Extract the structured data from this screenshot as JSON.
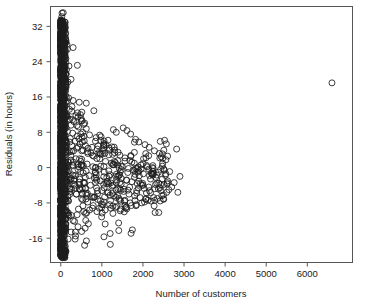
{
  "chart_data": {
    "type": "scatter",
    "title": "",
    "xlabel": "Number of customers",
    "ylabel": "Residuals (in hours)",
    "xlim": [
      -250,
      7100
    ],
    "ylim": [
      -21.5,
      36.5
    ],
    "xticks": [
      0,
      1000,
      2000,
      3000,
      4000,
      5000,
      6000
    ],
    "xticklabels": [
      "0",
      "1000",
      "2000",
      "3000",
      "4000",
      "5000",
      "6000"
    ],
    "yticks": [
      -16,
      -8,
      0,
      8,
      16,
      24,
      32
    ],
    "yticklabels": [
      "-16",
      "-8",
      "0",
      "8",
      "16",
      "24",
      "32"
    ],
    "grid": false,
    "legend": null,
    "marker": "open-circle",
    "marker_size": 3.0,
    "marker_color": "#1c1c1c",
    "frame_color": "#555555",
    "background_color": "#ffffff",
    "points": [
      [
        6600,
        19.2
      ],
      [
        30,
        35.0
      ],
      [
        60,
        35.1
      ],
      [
        25,
        34.2
      ],
      [
        45,
        32.6
      ],
      [
        20,
        32.3
      ],
      [
        55,
        31.0
      ],
      [
        35,
        30.4
      ],
      [
        70,
        29.8
      ],
      [
        40,
        29.2
      ],
      [
        90,
        28.5
      ],
      [
        150,
        27.9
      ],
      [
        300,
        27.2
      ],
      [
        160,
        26.8
      ],
      [
        65,
        28.0
      ],
      [
        85,
        27.0
      ],
      [
        110,
        26.2
      ],
      [
        50,
        25.8
      ],
      [
        30,
        25.0
      ],
      [
        75,
        24.4
      ],
      [
        120,
        23.8
      ],
      [
        200,
        23.0
      ],
      [
        140,
        22.2
      ],
      [
        60,
        21.6
      ],
      [
        40,
        21.0
      ],
      [
        95,
        20.4
      ],
      [
        250,
        20.0
      ],
      [
        175,
        19.4
      ],
      [
        55,
        18.8
      ],
      [
        130,
        18.2
      ],
      [
        80,
        17.6
      ],
      [
        45,
        17.0
      ],
      [
        115,
        16.4
      ],
      [
        190,
        15.8
      ],
      [
        300,
        15.2
      ],
      [
        450,
        14.8
      ],
      [
        620,
        14.6
      ],
      [
        70,
        15.6
      ],
      [
        155,
        15.0
      ],
      [
        100,
        14.2
      ],
      [
        35,
        13.8
      ],
      [
        210,
        13.2
      ],
      [
        265,
        12.8
      ],
      [
        410,
        12.4
      ],
      [
        480,
        12.0
      ],
      [
        90,
        12.6
      ],
      [
        140,
        11.8
      ],
      [
        60,
        11.2
      ],
      [
        180,
        10.8
      ],
      [
        320,
        10.4
      ],
      [
        520,
        10.6
      ],
      [
        560,
        9.8
      ],
      [
        430,
        9.2
      ],
      [
        250,
        9.6
      ],
      [
        130,
        9.0
      ],
      [
        75,
        8.6
      ],
      [
        165,
        8.2
      ],
      [
        290,
        7.8
      ],
      [
        620,
        8.8
      ],
      [
        700,
        7.4
      ],
      [
        860,
        6.8
      ],
      [
        980,
        7.0
      ],
      [
        1150,
        6.2
      ],
      [
        1280,
        8.6
      ],
      [
        1350,
        8.0
      ],
      [
        1520,
        9.0
      ],
      [
        1610,
        8.4
      ],
      [
        1700,
        7.6
      ],
      [
        1820,
        6.4
      ],
      [
        1900,
        5.8
      ],
      [
        2050,
        5.2
      ],
      [
        2150,
        4.6
      ],
      [
        2280,
        3.8
      ],
      [
        2400,
        3.2
      ],
      [
        2600,
        2.6
      ],
      [
        2820,
        4.2
      ],
      [
        110,
        7.2
      ],
      [
        230,
        6.6
      ],
      [
        350,
        6.0
      ],
      [
        470,
        5.4
      ],
      [
        600,
        5.0
      ],
      [
        760,
        4.6
      ],
      [
        890,
        4.2
      ],
      [
        1020,
        3.8
      ],
      [
        1180,
        4.4
      ],
      [
        1310,
        3.4
      ],
      [
        1440,
        2.8
      ],
      [
        1560,
        2.2
      ],
      [
        1680,
        1.6
      ],
      [
        1790,
        1.0
      ],
      [
        1950,
        0.6
      ],
      [
        2100,
        0.2
      ],
      [
        2250,
        -0.2
      ],
      [
        2430,
        -0.4
      ],
      [
        2520,
        -0.6
      ],
      [
        2650,
        -0.9
      ],
      [
        55,
        6.4
      ],
      [
        140,
        5.6
      ],
      [
        270,
        5.0
      ],
      [
        390,
        4.4
      ],
      [
        510,
        3.8
      ],
      [
        660,
        3.2
      ],
      [
        800,
        2.6
      ],
      [
        950,
        2.0
      ],
      [
        1090,
        1.4
      ],
      [
        1230,
        1.0
      ],
      [
        1380,
        0.6
      ],
      [
        1500,
        0.2
      ],
      [
        1650,
        -0.2
      ],
      [
        1760,
        -0.6
      ],
      [
        1880,
        -1.0
      ],
      [
        2010,
        -1.4
      ],
      [
        2160,
        -1.8
      ],
      [
        2310,
        -2.2
      ],
      [
        2470,
        -2.6
      ],
      [
        2600,
        -3.0
      ],
      [
        2760,
        -3.4
      ],
      [
        2900,
        -2.0
      ],
      [
        40,
        4.8
      ],
      [
        125,
        3.6
      ],
      [
        245,
        2.8
      ],
      [
        365,
        2.0
      ],
      [
        490,
        1.4
      ],
      [
        640,
        0.8
      ],
      [
        780,
        0.2
      ],
      [
        920,
        -0.4
      ],
      [
        1060,
        -1.0
      ],
      [
        1200,
        -1.6
      ],
      [
        1340,
        -2.0
      ],
      [
        1470,
        -2.4
      ],
      [
        1600,
        -2.8
      ],
      [
        1730,
        -3.2
      ],
      [
        1860,
        -3.6
      ],
      [
        2000,
        -4.0
      ],
      [
        2140,
        -4.4
      ],
      [
        2290,
        -4.8
      ],
      [
        2440,
        -5.2
      ],
      [
        2580,
        -5.6
      ],
      [
        2700,
        -4.4
      ],
      [
        2850,
        -5.6
      ],
      [
        65,
        2.4
      ],
      [
        180,
        1.2
      ],
      [
        300,
        0.4
      ],
      [
        420,
        -0.4
      ],
      [
        545,
        -1.2
      ],
      [
        690,
        -1.8
      ],
      [
        820,
        -2.4
      ],
      [
        960,
        -3.0
      ],
      [
        1110,
        -3.6
      ],
      [
        1250,
        -4.2
      ],
      [
        1390,
        -4.8
      ],
      [
        1530,
        -5.4
      ],
      [
        1660,
        -6.0
      ],
      [
        1800,
        -6.4
      ],
      [
        1930,
        -6.8
      ],
      [
        2070,
        -7.2
      ],
      [
        2200,
        -7.6
      ],
      [
        2350,
        -7.0
      ],
      [
        2500,
        -6.2
      ],
      [
        2630,
        -5.0
      ],
      [
        85,
        0.6
      ],
      [
        200,
        -0.8
      ],
      [
        330,
        -1.8
      ],
      [
        460,
        -2.6
      ],
      [
        580,
        -3.4
      ],
      [
        720,
        -4.0
      ],
      [
        870,
        -4.6
      ],
      [
        1000,
        -5.2
      ],
      [
        1140,
        -5.8
      ],
      [
        1290,
        -6.4
      ],
      [
        1420,
        -7.0
      ],
      [
        1550,
        -7.6
      ],
      [
        1690,
        -8.0
      ],
      [
        1840,
        -8.4
      ],
      [
        1970,
        -8.0
      ],
      [
        2120,
        -7.4
      ],
      [
        2260,
        -6.8
      ],
      [
        105,
        -1.4
      ],
      [
        225,
        -2.8
      ],
      [
        345,
        -4.0
      ],
      [
        475,
        -5.0
      ],
      [
        610,
        -5.8
      ],
      [
        750,
        -6.6
      ],
      [
        900,
        -7.2
      ],
      [
        1050,
        -7.8
      ],
      [
        1190,
        -8.4
      ],
      [
        1330,
        -9.0
      ],
      [
        1460,
        -9.4
      ],
      [
        1590,
        -9.0
      ],
      [
        1720,
        -8.6
      ],
      [
        135,
        -3.4
      ],
      [
        260,
        -4.8
      ],
      [
        380,
        -6.0
      ],
      [
        505,
        -7.0
      ],
      [
        655,
        -7.8
      ],
      [
        790,
        -8.6
      ],
      [
        940,
        -9.2
      ],
      [
        1080,
        -9.6
      ],
      [
        1220,
        -9.2
      ],
      [
        1360,
        -8.8
      ],
      [
        430,
        -9.4
      ],
      [
        560,
        -10.0
      ],
      [
        700,
        -9.6
      ],
      [
        600,
        -10.4
      ],
      [
        350,
        -16.2
      ],
      [
        580,
        -17.6
      ],
      [
        300,
        -12.0
      ],
      [
        420,
        -13.4
      ],
      [
        250,
        -14.6
      ],
      [
        200,
        -11.0
      ],
      [
        160,
        -10.2
      ],
      [
        120,
        -12.8
      ],
      [
        95,
        -14.0
      ],
      [
        75,
        -15.4
      ]
    ],
    "dense_band": {
      "description": "Over-plotted near-vertical column of residuals at very low customer counts",
      "x_range": [
        0,
        130
      ],
      "y_range": [
        -20.0,
        33.5
      ],
      "approx_count": 900
    },
    "bottom_blob": {
      "description": "Dark saturated cluster of minimum residuals at the floor",
      "x_range": [
        0,
        110
      ],
      "y_range": [
        -20.5,
        -18.5
      ],
      "approx_count": 40
    }
  }
}
